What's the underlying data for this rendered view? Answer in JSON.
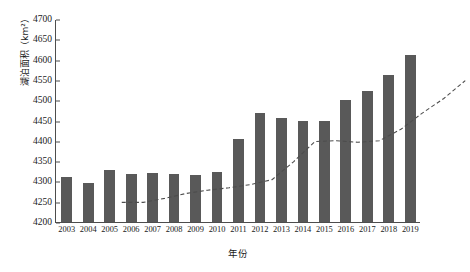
{
  "chart_data": {
    "type": "bar",
    "title": "",
    "subtitle": "",
    "xlabel": "年份",
    "ylabel": "湖泊面积（km²）",
    "categories": [
      "2003",
      "2004",
      "2005",
      "2006",
      "2007",
      "2008",
      "2009",
      "2010",
      "2011",
      "2012",
      "2013",
      "2014",
      "2015",
      "2016",
      "2017",
      "2018",
      "2019"
    ],
    "values": [
      4312,
      4296,
      4328,
      4318,
      4320,
      4318,
      4316,
      4322,
      4405,
      4468,
      4455,
      4450,
      4448,
      4500,
      4522,
      4562,
      4612
    ],
    "series": [
      {
        "name": "湖泊面积",
        "type": "bar",
        "color": "#595959",
        "values": [
          4312,
          4296,
          4328,
          4318,
          4320,
          4318,
          4316,
          4322,
          4405,
          4468,
          4455,
          4450,
          4448,
          4500,
          4522,
          4562,
          4612
        ]
      },
      {
        "name": "趋势线",
        "type": "line",
        "style": "dashed",
        "color": "#4d4d4d",
        "values": [
          4300,
          4300,
          4310,
          4322,
          4330,
          4336,
          4344,
          4356,
          4400,
          4450,
          4452,
          4448,
          4452,
          4480,
          4520,
          4556,
          4600
        ]
      }
    ],
    "ylim": [
      4200,
      4700
    ],
    "yticks": [
      4200,
      4250,
      4300,
      4350,
      4400,
      4450,
      4500,
      4550,
      4600,
      4650,
      4700
    ],
    "ytick_labels": [
      "4200",
      "4250",
      "4300",
      "4350",
      "4400",
      "4450",
      "4500",
      "4550",
      "4600",
      "4650",
      "4700"
    ],
    "grid": false,
    "legend": false,
    "legend_position": "none",
    "axis_color": "#4d4d4d",
    "background": "#ffffff"
  }
}
